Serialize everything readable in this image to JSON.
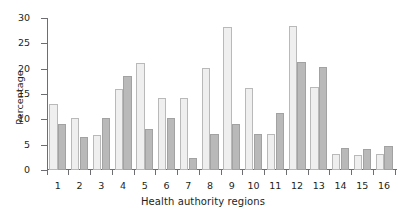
{
  "chart_data": {
    "type": "bar",
    "title": "",
    "xlabel": "Health authority regions",
    "ylabel": "Percentage",
    "categories": [
      "1",
      "2",
      "3",
      "4",
      "5",
      "6",
      "7",
      "8",
      "9",
      "10",
      "11",
      "12",
      "13",
      "14",
      "15",
      "16"
    ],
    "ylim": [
      0,
      30
    ],
    "yticks": [
      0,
      5,
      10,
      15,
      20,
      25,
      30
    ],
    "grid": false,
    "legend": "none",
    "series": [
      {
        "name": "Series 1",
        "color": "#efefef",
        "values": [
          13.0,
          10.2,
          7.0,
          16.0,
          21.1,
          14.2,
          14.3,
          20.1,
          28.3,
          16.2,
          7.2,
          28.5,
          16.3,
          3.1,
          3.0,
          3.1
        ]
      },
      {
        "name": "Series 2",
        "color": "#b9b9b9",
        "values": [
          9.0,
          6.6,
          10.2,
          18.5,
          8.0,
          10.2,
          2.4,
          7.1,
          9.0,
          7.1,
          11.2,
          21.3,
          20.3,
          4.3,
          4.1,
          4.8
        ]
      }
    ]
  }
}
